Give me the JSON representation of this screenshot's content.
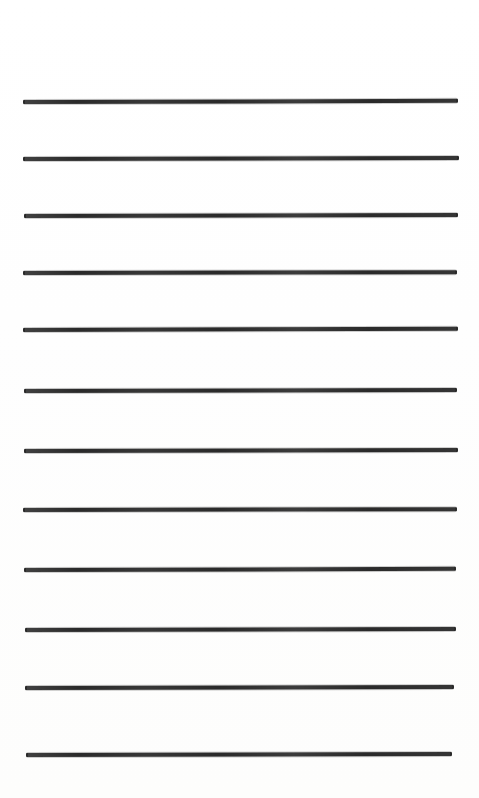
{
  "document": {
    "kind": "scanned-ruled-paper",
    "title": "Blank ruled writing paper",
    "page_width": 479,
    "page_height": 798,
    "background_color": "#fefefe",
    "rule_color": "#2b2b2b",
    "rule_count": 12,
    "rule_thickness": 4,
    "rule_spacing": 59,
    "has_text": false,
    "has_margin_line": false,
    "content_text": ""
  },
  "rules": [
    {
      "index": 1,
      "y": 100,
      "x_start": 23,
      "x_end": 458,
      "thickness": 4,
      "tilt_deg": -0.15
    },
    {
      "index": 2,
      "y": 157,
      "x_start": 23,
      "x_end": 459,
      "thickness": 4,
      "tilt_deg": -0.12
    },
    {
      "index": 3,
      "y": 214,
      "x_start": 24,
      "x_end": 458,
      "thickness": 4,
      "tilt_deg": -0.14
    },
    {
      "index": 4,
      "y": 271,
      "x_start": 23,
      "x_end": 457,
      "thickness": 4,
      "tilt_deg": -0.1
    },
    {
      "index": 5,
      "y": 328,
      "x_start": 23,
      "x_end": 458,
      "thickness": 4,
      "tilt_deg": -0.16
    },
    {
      "index": 6,
      "y": 389,
      "x_start": 24,
      "x_end": 457,
      "thickness": 4,
      "tilt_deg": -0.12
    },
    {
      "index": 7,
      "y": 449,
      "x_start": 24,
      "x_end": 458,
      "thickness": 4,
      "tilt_deg": -0.14
    },
    {
      "index": 8,
      "y": 508,
      "x_start": 23,
      "x_end": 457,
      "thickness": 4,
      "tilt_deg": -0.11
    },
    {
      "index": 9,
      "y": 568,
      "x_start": 24,
      "x_end": 456,
      "thickness": 4,
      "tilt_deg": -0.15
    },
    {
      "index": 10,
      "y": 628,
      "x_start": 25,
      "x_end": 456,
      "thickness": 4,
      "tilt_deg": -0.13
    },
    {
      "index": 11,
      "y": 686,
      "x_start": 25,
      "x_end": 454,
      "thickness": 4,
      "tilt_deg": -0.12
    },
    {
      "index": 12,
      "y": 753,
      "x_start": 26,
      "x_end": 452,
      "thickness": 4,
      "tilt_deg": -0.14
    }
  ],
  "margins": {
    "top_margin_height": 100,
    "bottom_margin_height": 45,
    "left_margin_width": 23,
    "right_margin_width": 21
  }
}
